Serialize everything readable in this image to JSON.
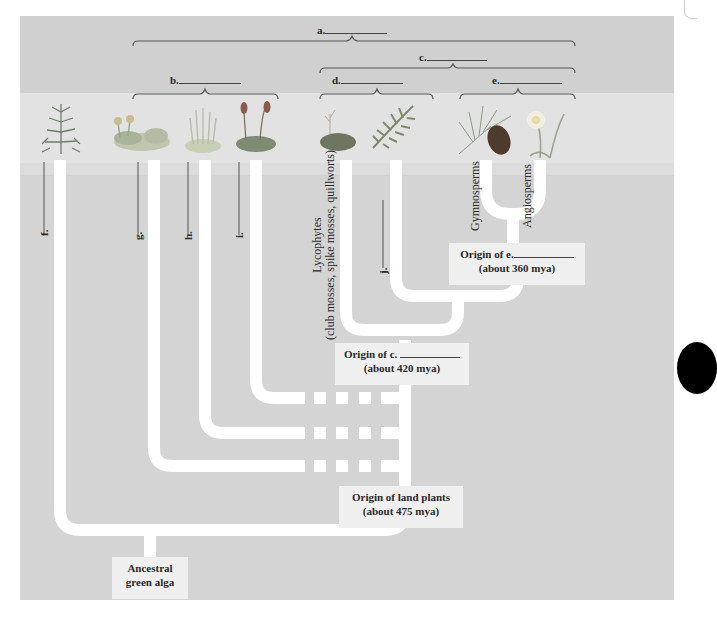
{
  "diagram": {
    "colors": {
      "panel": "#d4d4d4",
      "band": "#e2e2e2",
      "branch": "#ffffff",
      "box": "#efefef",
      "bracket": "#444444"
    },
    "brackets": [
      {
        "id": "a",
        "label": "a.",
        "spans": [
          "liverworts",
          "hornworts",
          "mosses",
          "lycophytes",
          "ferns",
          "gymnosperms",
          "angiosperms"
        ]
      },
      {
        "id": "b",
        "label": "b.",
        "spans": [
          "liverworts",
          "hornworts",
          "mosses"
        ]
      },
      {
        "id": "c",
        "label": "c.",
        "spans": [
          "lycophytes",
          "ferns",
          "gymnosperms",
          "angiosperms"
        ]
      },
      {
        "id": "d",
        "label": "d.",
        "spans": [
          "lycophytes",
          "ferns"
        ]
      },
      {
        "id": "e",
        "label": "e.",
        "spans": [
          "gymnosperms",
          "angiosperms"
        ]
      }
    ],
    "tips": [
      {
        "id": "f",
        "label": "f.",
        "plant": "charophyte-alga"
      },
      {
        "id": "g",
        "label": "g.",
        "plant": "liverwort"
      },
      {
        "id": "h",
        "label": "h.",
        "plant": "hornwort"
      },
      {
        "id": "i",
        "label": "i.",
        "plant": "moss"
      },
      {
        "id": "lyco",
        "label": "Lycophytes",
        "sublabel": "(club mosses, spike mosses, quillworts)",
        "plant": "club-moss"
      },
      {
        "id": "j",
        "label": "j.",
        "plant": "fern"
      },
      {
        "id": "gymno",
        "label": "Gymnosperms",
        "plant": "pine-cone"
      },
      {
        "id": "angio",
        "label": "Angiosperms",
        "plant": "daffodil"
      }
    ],
    "nodes": [
      {
        "id": "seed",
        "title": "Origin of e.",
        "subtitle": "(about 360 mya)"
      },
      {
        "id": "vascular",
        "title": "Origin of c.",
        "subtitle": "(about 420 mya)"
      },
      {
        "id": "land",
        "title": "Origin of land plants",
        "subtitle": "(about 475 mya)"
      },
      {
        "id": "root",
        "title": "Ancestral",
        "subtitle": "green alga"
      }
    ]
  }
}
